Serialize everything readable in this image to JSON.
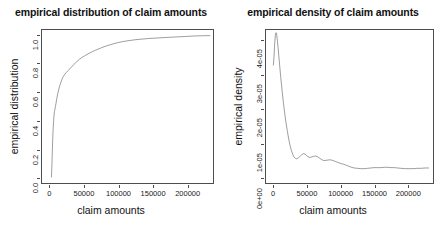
{
  "figure": {
    "width": 444,
    "height": 233,
    "background": "#ffffff",
    "line_color": "#4d4d4d",
    "text_color": "#1a1a1a",
    "panels": 2
  },
  "chart_data": [
    {
      "type": "line",
      "name": "empirical-distribution",
      "title": "empirical distribution of claim amounts",
      "xlabel": "claim amounts",
      "ylabel": "empirical distribution",
      "xlim": [
        -12000,
        238000
      ],
      "ylim": [
        -0.04,
        1.04
      ],
      "xticks": [
        0,
        50000,
        100000,
        150000,
        200000
      ],
      "xticklabels": [
        "0",
        "50000",
        "100000",
        "150000",
        "200000"
      ],
      "yticks": [
        0.0,
        0.2,
        0.4,
        0.6,
        0.8,
        1.0
      ],
      "yticklabels": [
        "0.0",
        "0.2",
        "0.4",
        "0.6",
        "0.8",
        "1.0"
      ],
      "grid": false,
      "legend": "none",
      "series": [
        {
          "name": "ECDF",
          "x": [
            1800,
            2000,
            2200,
            2500,
            2800,
            3200,
            3600,
            4000,
            4500,
            5000,
            5600,
            6200,
            6900,
            7600,
            8400,
            9200,
            10000,
            11000,
            12000,
            13000,
            14500,
            16000,
            17500,
            19000,
            21000,
            23000,
            25000,
            27000,
            29000,
            31500,
            34000,
            37000,
            40000,
            43000,
            46500,
            50000,
            54000,
            58000,
            62000,
            66000,
            70000,
            75000,
            80000,
            85000,
            90000,
            95000,
            100000,
            106000,
            112000,
            118000,
            124000,
            130000,
            137000,
            144000,
            151000,
            158000,
            165000,
            172000,
            180000,
            188000,
            196000,
            204000,
            212000,
            220000,
            228000,
            234000
          ],
          "y": [
            0.0,
            0.02,
            0.05,
            0.09,
            0.14,
            0.2,
            0.26,
            0.31,
            0.36,
            0.4,
            0.44,
            0.465,
            0.48,
            0.5,
            0.52,
            0.545,
            0.565,
            0.59,
            0.61,
            0.63,
            0.655,
            0.675,
            0.695,
            0.71,
            0.725,
            0.738,
            0.748,
            0.757,
            0.768,
            0.781,
            0.794,
            0.808,
            0.822,
            0.834,
            0.846,
            0.857,
            0.868,
            0.878,
            0.888,
            0.897,
            0.905,
            0.915,
            0.924,
            0.932,
            0.939,
            0.946,
            0.952,
            0.958,
            0.963,
            0.967,
            0.971,
            0.974,
            0.977,
            0.98,
            0.982,
            0.984,
            0.986,
            0.988,
            0.99,
            0.992,
            0.994,
            0.996,
            0.998,
            0.999,
            1.0,
            1.0
          ]
        }
      ]
    },
    {
      "type": "line",
      "name": "empirical-density",
      "title": "empirical density of claim amounts",
      "xlabel": "claim amounts",
      "ylabel": "empirical density",
      "xlim": [
        -12000,
        238000
      ],
      "ylim": [
        -1.6e-06,
        4.32e-05
      ],
      "xticks": [
        0,
        50000,
        100000,
        150000,
        200000
      ],
      "xticklabels": [
        "0",
        "50000",
        "100000",
        "150000",
        "200000"
      ],
      "yticks": [
        0.0,
        1e-05,
        2e-05,
        3e-05,
        4e-05
      ],
      "yticklabels": [
        "0e+00",
        "1e-05",
        "2e-05",
        "3e-05",
        "4e-05"
      ],
      "grid": false,
      "legend": "none",
      "series": [
        {
          "name": "kernel density",
          "x": [
            -1000,
            0,
            1000,
            2000,
            3000,
            4000,
            5000,
            6000,
            7000,
            8000,
            10000,
            12000,
            14000,
            16000,
            18000,
            20000,
            22000,
            24000,
            26000,
            28000,
            30000,
            32000,
            34000,
            36000,
            38000,
            40000,
            42000,
            44000,
            46000,
            48000,
            50000,
            53000,
            56000,
            59000,
            62000,
            65000,
            68000,
            71000,
            74000,
            77000,
            80000,
            84000,
            88000,
            92000,
            96000,
            100000,
            104000,
            108000,
            112000,
            116000,
            120000,
            125000,
            130000,
            135000,
            140000,
            145000,
            150000,
            155000,
            160000,
            165000,
            170000,
            175000,
            180000,
            185000,
            190000,
            196000,
            202000,
            208000,
            214000,
            220000,
            226000,
            232000
          ],
          "y": [
            3.28e-05,
            3.55e-05,
            3.92e-05,
            4.16e-05,
            4.24e-05,
            4.18e-05,
            4.02e-05,
            3.82e-05,
            3.6e-05,
            3.38e-05,
            2.95e-05,
            2.56e-05,
            2.2e-05,
            1.88e-05,
            1.6e-05,
            1.35e-05,
            1.13e-05,
            9.4e-06,
            7.9e-06,
            6.8e-06,
            6e-06,
            5.6e-06,
            5.5e-06,
            5.7e-06,
            6e-06,
            6.4e-06,
            6.8e-06,
            7e-06,
            6.9e-06,
            6.6e-06,
            6.2e-06,
            5.9e-06,
            6e-06,
            6.2e-06,
            6.3e-06,
            6.1e-06,
            5.7e-06,
            5.3e-06,
            5e-06,
            5e-06,
            5.1e-06,
            5.2e-06,
            5e-06,
            4.7e-06,
            4.4e-06,
            4.1e-06,
            3.9e-06,
            3.6e-06,
            3.3e-06,
            3e-06,
            2.8e-06,
            2.7e-06,
            2.6e-06,
            2.6e-06,
            2.7e-06,
            2.8e-06,
            2.9e-06,
            2.9e-06,
            2.9e-06,
            3e-06,
            3e-06,
            2.9e-06,
            2.9e-06,
            2.8e-06,
            2.7e-06,
            2.6e-06,
            2.6e-06,
            2.6e-06,
            2.7e-06,
            2.7e-06,
            2.8e-06,
            2.8e-06
          ]
        }
      ]
    }
  ]
}
